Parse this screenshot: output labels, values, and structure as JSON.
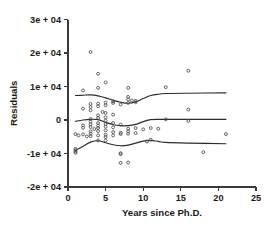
{
  "chart_data": {
    "type": "scatter",
    "title": "",
    "xlabel": "Years since Ph.D.",
    "ylabel": "Residuals",
    "xlim": [
      0,
      25
    ],
    "ylim": [
      -20000,
      30000
    ],
    "grid": false,
    "legend": "none",
    "xticks": [
      0,
      5,
      10,
      15,
      20,
      25
    ],
    "xtick_labels": [
      "0",
      "5",
      "10",
      "15",
      "20",
      "25"
    ],
    "yticks": [
      -20000,
      -10000,
      0,
      10000,
      20000,
      30000
    ],
    "ytick_labels": [
      "-2e + 04",
      "-1e + 04",
      "0",
      "1e + 04",
      "2e + 04",
      "3e + 04"
    ],
    "marker": "open-circle",
    "points": [
      {
        "x": 1,
        "y": -4200
      },
      {
        "x": 1,
        "y": -8600
      },
      {
        "x": 1,
        "y": -9000
      },
      {
        "x": 1,
        "y": -9400
      },
      {
        "x": 1,
        "y": -9800
      },
      {
        "x": 1.4,
        "y": -4600
      },
      {
        "x": 2,
        "y": 8800
      },
      {
        "x": 2,
        "y": 3400
      },
      {
        "x": 2,
        "y": -1600
      },
      {
        "x": 2,
        "y": -2300
      },
      {
        "x": 2,
        "y": -4300
      },
      {
        "x": 2.5,
        "y": -4900
      },
      {
        "x": 3,
        "y": 20300
      },
      {
        "x": 3,
        "y": 4800
      },
      {
        "x": 3,
        "y": 3900
      },
      {
        "x": 3,
        "y": 2900
      },
      {
        "x": 3,
        "y": 300
      },
      {
        "x": 3,
        "y": -500
      },
      {
        "x": 3,
        "y": -1300
      },
      {
        "x": 3,
        "y": -2100
      },
      {
        "x": 3,
        "y": -3400
      },
      {
        "x": 3,
        "y": -4100
      },
      {
        "x": 3,
        "y": -4800
      },
      {
        "x": 3.5,
        "y": -2700
      },
      {
        "x": 4,
        "y": 13800
      },
      {
        "x": 4,
        "y": 9600
      },
      {
        "x": 4,
        "y": 4900
      },
      {
        "x": 4,
        "y": 4100
      },
      {
        "x": 4,
        "y": 1400
      },
      {
        "x": 4,
        "y": 600
      },
      {
        "x": 4,
        "y": -900
      },
      {
        "x": 4,
        "y": -1700
      },
      {
        "x": 4,
        "y": -2400
      },
      {
        "x": 4,
        "y": -3300
      },
      {
        "x": 4,
        "y": -4600
      },
      {
        "x": 4,
        "y": -6100
      },
      {
        "x": 4.6,
        "y": 2400
      },
      {
        "x": 5,
        "y": 11200
      },
      {
        "x": 5,
        "y": 5200
      },
      {
        "x": 5,
        "y": 4400
      },
      {
        "x": 5,
        "y": 2100
      },
      {
        "x": 5,
        "y": 800
      },
      {
        "x": 5,
        "y": -200
      },
      {
        "x": 5,
        "y": -1200
      },
      {
        "x": 5,
        "y": -2000
      },
      {
        "x": 5,
        "y": -3100
      },
      {
        "x": 5,
        "y": -4400
      },
      {
        "x": 5,
        "y": -5100
      },
      {
        "x": 5,
        "y": -6100
      },
      {
        "x": 6,
        "y": 5600
      },
      {
        "x": 6,
        "y": 5100
      },
      {
        "x": 6,
        "y": 1600
      },
      {
        "x": 6,
        "y": -900
      },
      {
        "x": 6,
        "y": -2200
      },
      {
        "x": 6,
        "y": -3600
      },
      {
        "x": 6,
        "y": -4600
      },
      {
        "x": 7,
        "y": 4600
      },
      {
        "x": 7,
        "y": -1400
      },
      {
        "x": 7,
        "y": -3800
      },
      {
        "x": 7,
        "y": -4200
      },
      {
        "x": 7,
        "y": -9900
      },
      {
        "x": 7,
        "y": -10200
      },
      {
        "x": 7,
        "y": -12800
      },
      {
        "x": 8,
        "y": 9600
      },
      {
        "x": 8,
        "y": 6900
      },
      {
        "x": 8,
        "y": 6100
      },
      {
        "x": 8,
        "y": 5100
      },
      {
        "x": 8,
        "y": -2600
      },
      {
        "x": 8,
        "y": -3400
      },
      {
        "x": 8,
        "y": -4100
      },
      {
        "x": 8,
        "y": -12700
      },
      {
        "x": 8.5,
        "y": 5800
      },
      {
        "x": 9,
        "y": 5700
      },
      {
        "x": 9,
        "y": 5300
      },
      {
        "x": 9,
        "y": -2400
      },
      {
        "x": 9,
        "y": -3900
      },
      {
        "x": 10,
        "y": -2800
      },
      {
        "x": 10.5,
        "y": -6400
      },
      {
        "x": 11,
        "y": -2400
      },
      {
        "x": 11,
        "y": -5900
      },
      {
        "x": 12,
        "y": -2600
      },
      {
        "x": 13,
        "y": 9800
      },
      {
        "x": 13,
        "y": 200
      },
      {
        "x": 16,
        "y": 14700
      },
      {
        "x": 16,
        "y": 3100
      },
      {
        "x": 16,
        "y": -300
      },
      {
        "x": 18,
        "y": -9600
      },
      {
        "x": 21,
        "y": -4200
      }
    ],
    "curves": [
      {
        "name": "upper-quantile-smooth",
        "points": [
          {
            "x": 1,
            "y": 7300
          },
          {
            "x": 2,
            "y": 7400
          },
          {
            "x": 3,
            "y": 7500
          },
          {
            "x": 4,
            "y": 7200
          },
          {
            "x": 5,
            "y": 6600
          },
          {
            "x": 6,
            "y": 5900
          },
          {
            "x": 7,
            "y": 5300
          },
          {
            "x": 8,
            "y": 5000
          },
          {
            "x": 9,
            "y": 5400
          },
          {
            "x": 10,
            "y": 6400
          },
          {
            "x": 11,
            "y": 7300
          },
          {
            "x": 12,
            "y": 7700
          },
          {
            "x": 13,
            "y": 7900
          },
          {
            "x": 16,
            "y": 8000
          },
          {
            "x": 21,
            "y": 8100
          }
        ]
      },
      {
        "name": "median-smooth",
        "points": [
          {
            "x": 1,
            "y": -400
          },
          {
            "x": 2,
            "y": 0
          },
          {
            "x": 3,
            "y": 200
          },
          {
            "x": 4,
            "y": 100
          },
          {
            "x": 5,
            "y": -700
          },
          {
            "x": 6,
            "y": -1400
          },
          {
            "x": 7,
            "y": -1700
          },
          {
            "x": 8,
            "y": -1700
          },
          {
            "x": 9,
            "y": -1300
          },
          {
            "x": 10,
            "y": -500
          },
          {
            "x": 11,
            "y": 100
          },
          {
            "x": 12,
            "y": 200
          },
          {
            "x": 13,
            "y": 200
          },
          {
            "x": 16,
            "y": 200
          },
          {
            "x": 21,
            "y": 200
          }
        ]
      },
      {
        "name": "lower-quantile-smooth",
        "points": [
          {
            "x": 1,
            "y": -9100
          },
          {
            "x": 2,
            "y": -7800
          },
          {
            "x": 3,
            "y": -6600
          },
          {
            "x": 4,
            "y": -6200
          },
          {
            "x": 5,
            "y": -6800
          },
          {
            "x": 6,
            "y": -7400
          },
          {
            "x": 7,
            "y": -7700
          },
          {
            "x": 8,
            "y": -7500
          },
          {
            "x": 9,
            "y": -6900
          },
          {
            "x": 10,
            "y": -6300
          },
          {
            "x": 11,
            "y": -6100
          },
          {
            "x": 12,
            "y": -6400
          },
          {
            "x": 13,
            "y": -6700
          },
          {
            "x": 16,
            "y": -6900
          },
          {
            "x": 21,
            "y": -7100
          }
        ]
      }
    ]
  }
}
